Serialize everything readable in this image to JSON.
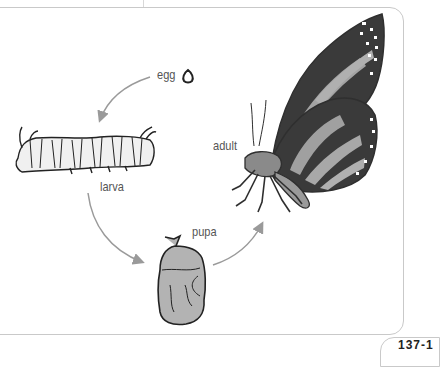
{
  "diagram": {
    "stages": [
      {
        "id": "egg",
        "label": "egg"
      },
      {
        "id": "larva",
        "label": "larva"
      },
      {
        "id": "pupa",
        "label": "pupa"
      },
      {
        "id": "adult",
        "label": "adult"
      }
    ],
    "arrows": [
      {
        "from": "egg",
        "to": "larva"
      },
      {
        "from": "larva",
        "to": "pupa"
      },
      {
        "from": "pupa",
        "to": "adult"
      }
    ],
    "colors": {
      "arrow": "#9a9a9a",
      "label": "#555555",
      "panel_border": "#c9c9c9",
      "wing_fill": "#9e9e9e",
      "wing_vein": "#3a3a3a",
      "pupa_fill": "#b3b3b3"
    },
    "page_number_fragment": "137-1"
  }
}
